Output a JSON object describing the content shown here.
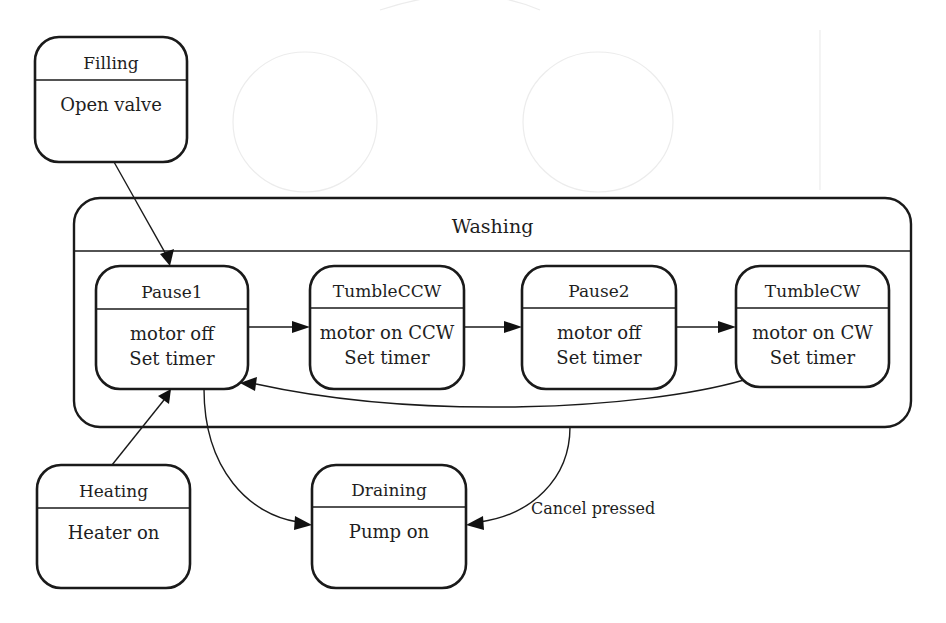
{
  "diagram": {
    "type": "UML state machine",
    "composite_state": {
      "id": "washing",
      "name": "Washing",
      "x": 74,
      "y": 198,
      "w": 837,
      "h": 229,
      "r": 26,
      "divider_y": 251
    },
    "states": [
      {
        "id": "filling",
        "name": "Filling",
        "actions": [
          "Open valve"
        ],
        "x": 35,
        "y": 37,
        "w": 152,
        "h": 125,
        "divider_y": 80
      },
      {
        "id": "pause1",
        "name": "Pause1",
        "actions": [
          "motor off",
          "Set timer"
        ],
        "x": 96,
        "y": 266,
        "w": 152,
        "h": 123,
        "divider_y": 309
      },
      {
        "id": "tumbleccw",
        "name": "TumbleCCW",
        "actions": [
          "motor on CCW",
          "Set timer"
        ],
        "x": 310,
        "y": 266,
        "w": 154,
        "h": 123,
        "divider_y": 308
      },
      {
        "id": "pause2",
        "name": "Pause2",
        "actions": [
          "motor off",
          "Set timer"
        ],
        "x": 522,
        "y": 266,
        "w": 154,
        "h": 123,
        "divider_y": 308
      },
      {
        "id": "tumblecw",
        "name": "TumbleCW",
        "actions": [
          "motor on CW",
          "Set timer"
        ],
        "x": 736,
        "y": 266,
        "w": 153,
        "h": 121,
        "divider_y": 308
      },
      {
        "id": "heating",
        "name": "Heating",
        "actions": [
          "Heater on"
        ],
        "x": 37,
        "y": 465,
        "w": 153,
        "h": 123,
        "divider_y": 508
      },
      {
        "id": "draining",
        "name": "Draining",
        "actions": [
          "Pump on"
        ],
        "x": 312,
        "y": 465,
        "w": 154,
        "h": 123,
        "divider_y": 507
      }
    ],
    "transitions": [
      {
        "id": "filling-to-pause1",
        "from": "Filling",
        "to": "Pause1",
        "label": "",
        "path": "M 114 162 L 168 258",
        "arrow": [
          [
            170,
            266
          ],
          [
            160,
            254
          ],
          [
            174,
            249
          ]
        ]
      },
      {
        "id": "pause1-to-tumbleccw",
        "from": "Pause1",
        "to": "TumbleCCW",
        "label": "",
        "path": "M 248 327 L 296 327",
        "arrow": [
          [
            310,
            327
          ],
          [
            292,
            321
          ],
          [
            292,
            333
          ]
        ]
      },
      {
        "id": "tumbleccw-to-pause2",
        "from": "TumbleCCW",
        "to": "Pause2",
        "label": "",
        "path": "M 464 327 L 508 327",
        "arrow": [
          [
            522,
            327
          ],
          [
            504,
            321
          ],
          [
            504,
            333
          ]
        ]
      },
      {
        "id": "pause2-to-tumblecw",
        "from": "Pause2",
        "to": "TumbleCW",
        "label": "",
        "path": "M 676 327 L 722 327",
        "arrow": [
          [
            736,
            327
          ],
          [
            718,
            321
          ],
          [
            718,
            333
          ]
        ]
      },
      {
        "id": "tumblecw-to-pause1",
        "from": "TumbleCW",
        "to": "Pause1",
        "label": "",
        "path": "M 744 380 C 640 410, 420 420, 256 384",
        "arrow": [
          [
            240,
            383
          ],
          [
            257,
            377
          ],
          [
            255,
            391
          ]
        ]
      },
      {
        "id": "heating-to-pause1",
        "from": "Heating",
        "to": "Pause1",
        "label": "",
        "path": "M 112 465 L 164 400",
        "arrow": [
          [
            171,
            389
          ],
          [
            169,
            404
          ],
          [
            158,
            396
          ]
        ]
      },
      {
        "id": "pause1-to-draining",
        "from": "Pause1",
        "to": "Draining",
        "label": "",
        "path": "M 204 389 C 204 470, 250 515, 298 522",
        "arrow": [
          [
            312,
            525
          ],
          [
            295,
            516
          ],
          [
            294,
            530
          ]
        ]
      },
      {
        "id": "washing-to-draining",
        "from": "Washing",
        "to": "Draining",
        "label": "Cancel pressed",
        "label_x": 531,
        "label_y": 514,
        "path": "M 570 427 C 570 480, 530 515, 480 522",
        "arrow": [
          [
            466,
            525
          ],
          [
            483,
            516
          ],
          [
            484,
            530
          ]
        ]
      }
    ],
    "colors": {
      "line": "#1a1a1a",
      "background": "#ffffff",
      "text": "#1e1e1e"
    }
  }
}
